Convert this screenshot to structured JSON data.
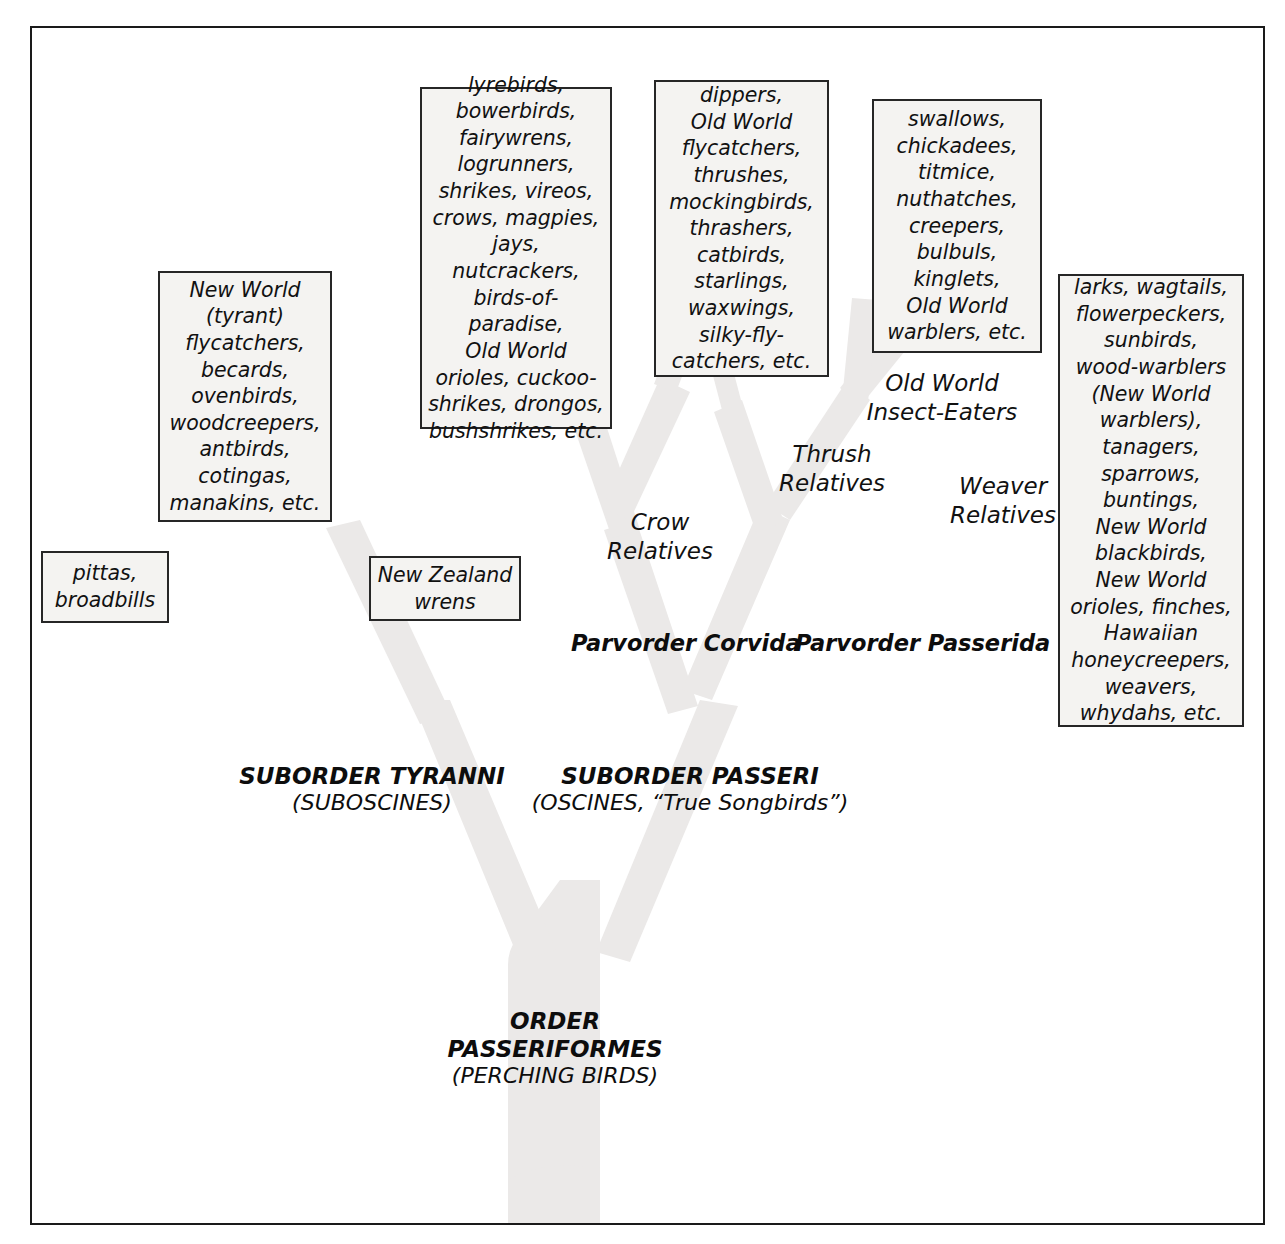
{
  "diagram": {
    "title_rank": {
      "main": "ORDER\nPASSERIFORMES",
      "sub": "(PERCHING BIRDS)"
    },
    "suborders": [
      {
        "id": "tyranni",
        "main": "SUBORDER TYRANNI",
        "sub": "(SUBOSCINES)"
      },
      {
        "id": "passeri",
        "main": "SUBORDER PASSERI",
        "sub": "(OSCINES, “True Songbirds”)"
      }
    ],
    "parvorders": [
      {
        "id": "corvida",
        "label": "Parvorder Corvida"
      },
      {
        "id": "passerida",
        "label": "Parvorder Passerida"
      }
    ],
    "group_labels": [
      {
        "id": "crow-relatives",
        "label": "Crow\nRelatives"
      },
      {
        "id": "thrush-relatives",
        "label": "Thrush\nRelatives"
      },
      {
        "id": "old-world-insect-eaters",
        "label": "Old World\nInsect-Eaters"
      },
      {
        "id": "weaver-relatives",
        "label": "Weaver\nRelatives"
      }
    ],
    "taxa_boxes": [
      {
        "id": "pittas-broadbills",
        "text": "pittas,\nbroadbills"
      },
      {
        "id": "new-world-tyrant-flycatchers",
        "text": "New World\n(tyrant)\nflycatchers,\nbecards,\novenbirds,\nwoodcreepers,\nantbirds,\ncotingas,\nmanakins, etc."
      },
      {
        "id": "new-zealand-wrens",
        "text": "New Zealand\nwrens"
      },
      {
        "id": "crow-relatives-taxa",
        "text": "lyrebirds,\nbowerbirds,\nfairywrens,\nlogrunners,\nshrikes, vireos,\ncrows, magpies,\njays, nutcrackers,\nbirds-of-paradise,\nOld World\norioles, cuckoo-\nshrikes, drongos,\nbushshrikes, etc."
      },
      {
        "id": "thrush-relatives-taxa",
        "text": "dippers,\nOld World\nflycatchers,\nthrushes,\nmockingbirds,\nthrashers,\ncatbirds,\nstarlings,\nwaxwings,\nsilky-fly-\ncatchers, etc."
      },
      {
        "id": "old-world-insect-eaters-taxa",
        "text": "swallows,\nchickadees,\ntitmice,\nnuthatches,\ncreepers,\nbulbuls,\nkinglets,\nOld World\nwarblers, etc."
      },
      {
        "id": "weaver-relatives-taxa",
        "text": "larks, wagtails,\nflowerpeckers,\nsunbirds,\nwood-warblers\n(New World\nwarblers),\ntanagers,\nsparrows,\nbuntings,\nNew World\nblackbirds,\nNew World\norioles, finches,\nHawaiian\nhoneycreepers,\nweavers,\nwhydahs, etc."
      }
    ],
    "colors": {
      "frame_border": "#1a1a1a",
      "box_border": "#262626",
      "box_fill": "#f4f3f1",
      "text": "#111111",
      "tree_fill": "#ebe9e8"
    }
  }
}
